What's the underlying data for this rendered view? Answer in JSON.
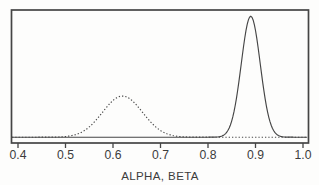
{
  "figure": {
    "background": "#fdfdfc",
    "ink_color": "#454545",
    "text_color": "#3c3c3c"
  },
  "chart_data": {
    "type": "line",
    "title": "",
    "subtitle": "",
    "xlabel": "ALPHA, BETA",
    "ylabel": "",
    "legend": "none",
    "grid": false,
    "frame": "full-box",
    "xlim": [
      0.383,
      1.012
    ],
    "ylim_relative": [
      0,
      1.06
    ],
    "x_ticks": [
      0.4,
      0.5,
      0.6,
      0.7,
      0.8,
      0.9,
      1.0
    ],
    "x_tick_labels": [
      "0.4",
      "0.5",
      "0.6",
      "0.7",
      "0.8",
      "0.9",
      "1.0"
    ],
    "y_ticks": [],
    "series": [
      {
        "name": "dashed-density-curve",
        "line_style": "dashed",
        "curve": "gaussian",
        "peak_x": 0.62,
        "sd": 0.042,
        "peak_height": 0.34,
        "color": "#4a4a4a"
      },
      {
        "name": "solid-density-curve",
        "line_style": "solid",
        "curve": "gaussian",
        "peak_x": 0.89,
        "sd": 0.02,
        "peak_height": 1.0,
        "color": "#454545"
      }
    ]
  }
}
